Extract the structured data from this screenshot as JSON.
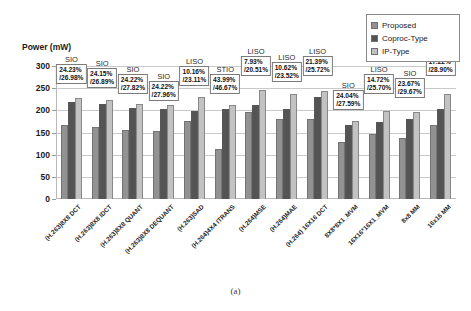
{
  "figure": {
    "caption": "(a)",
    "ylabel": "Power (mW)"
  },
  "legend": {
    "position": "top-right",
    "items": [
      {
        "label": "Proposed",
        "color": "#929292",
        "icon": "square-swatch-icon"
      },
      {
        "label": "Coproc-Type",
        "color": "#545454",
        "icon": "square-swatch-icon"
      },
      {
        "label": "IP-Type",
        "color": "#c2c2c2",
        "icon": "square-swatch-icon"
      }
    ]
  },
  "chart_data": {
    "type": "bar",
    "title": "",
    "subtitle": "",
    "xlabel": "",
    "ylabel": "Power (mW)",
    "ylim": [
      0,
      300
    ],
    "yticks": [
      0,
      50,
      100,
      150,
      200,
      250,
      300
    ],
    "grid": true,
    "legend_position": "top-right",
    "categories": [
      "(H.263)8X8 DCT",
      "(H.263)8X8 IDCT",
      "(H.263)8X8 QUANT",
      "(H.263)8X8 DEQUANT",
      "(H.263)SAD",
      "(H.264)4X4 ITRANS",
      "(H.264)MSE",
      "(H.264)MAE",
      "(H.264) 16X16 DCT",
      "8X8*8X1_MVM",
      "16X16*16X1_MVM",
      "8x8 MM",
      "16x16 MM"
    ],
    "series": [
      {
        "name": "Proposed",
        "color": "#929292",
        "values": [
          166,
          163,
          155,
          153,
          176,
          112,
          196,
          181,
          180,
          128,
          146,
          137,
          167
        ]
      },
      {
        "name": "Coproc-Type",
        "color": "#545454",
        "values": [
          219,
          215,
          206,
          202,
          199,
          202,
          213,
          204,
          230,
          166,
          173,
          180,
          204
        ]
      },
      {
        "name": "IP-Type",
        "color": "#c2c2c2",
        "values": [
          228,
          223,
          215,
          213,
          229,
          211,
          246,
          238,
          244,
          176,
          199,
          196,
          236
        ]
      }
    ],
    "annotations": [
      {
        "category": "(H.263)8X8 DCT",
        "type": "SIO",
        "saving_vs_coproc": "24.23%",
        "saving_vs_ip": "/26.98%"
      },
      {
        "category": "(H.263)8X8 IDCT",
        "type": "SIO",
        "saving_vs_coproc": "24.15%",
        "saving_vs_ip": "/26.89%"
      },
      {
        "category": "(H.263)8X8 QUANT",
        "type": "SIO",
        "saving_vs_coproc": "24.22%",
        "saving_vs_ip": "/27.82%"
      },
      {
        "category": "(H.263)8X8 DEQUANT",
        "type": "SIO",
        "saving_vs_coproc": "24.22%",
        "saving_vs_ip": "/27.96%"
      },
      {
        "category": "(H.263)SAD",
        "type": "LISO",
        "saving_vs_coproc": "10.16%",
        "saving_vs_ip": "/23.11%"
      },
      {
        "category": "(H.264)4X4 ITRANS",
        "type": "STIO",
        "saving_vs_coproc": "43.99%",
        "saving_vs_ip": "/46.67%"
      },
      {
        "category": "(H.264)MSE",
        "type": "LISO",
        "saving_vs_coproc": "7.93%",
        "saving_vs_ip": "/20.51%"
      },
      {
        "category": "(H.264)MAE",
        "type": "LISO",
        "saving_vs_coproc": "10.62%",
        "saving_vs_ip": "/23.52%"
      },
      {
        "category": "(H.264) 16X16 DCT",
        "type": "LISO",
        "saving_vs_coproc": "21.39%",
        "saving_vs_ip": "/25.72%"
      },
      {
        "category": "8X8*8X1_MVM",
        "type": "SIO",
        "saving_vs_coproc": "24.04%",
        "saving_vs_ip": "/27.59%"
      },
      {
        "category": "16X16*16X1_MVM",
        "type": "LISO",
        "saving_vs_coproc": "14.72%",
        "saving_vs_ip": "/25.70%"
      },
      {
        "category": "8x8 MM",
        "type": "SIO",
        "saving_vs_coproc": "23.67%",
        "saving_vs_ip": "/29.67%"
      },
      {
        "category": "16x16 MM",
        "type": "LISO",
        "saving_vs_coproc": "17.22%",
        "saving_vs_ip": "/28.90%"
      }
    ]
  },
  "annotation_layout": {
    "box_tops": [
      70,
      74,
      80,
      87,
      72,
      80,
      62,
      68,
      62,
      96,
      80,
      84,
      62
    ],
    "title_tops": [
      56,
      60,
      66,
      73,
      58,
      66,
      48,
      54,
      48,
      82,
      66,
      70,
      48
    ]
  }
}
